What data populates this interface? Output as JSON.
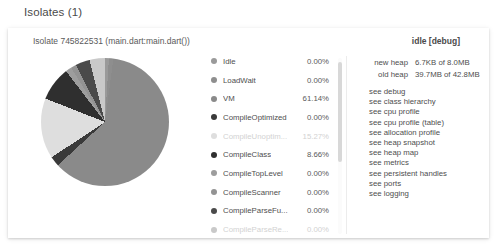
{
  "page": {
    "title": "Isolates (1)"
  },
  "isolate": {
    "title": "Isolate 745822531 (main.dart:main.dart())",
    "state": "idle [debug]"
  },
  "chart_data": {
    "type": "pie",
    "title": "Isolate 745822531 (main.dart:main.dart())",
    "legend_position": "right",
    "categories": [
      "Idle",
      "LoadWait",
      "VM",
      "CompileOptimized",
      "CompileUnoptim...",
      "CompileClass",
      "CompileTopLevel",
      "CompileScanner",
      "CompileParseFu...",
      "CompileParseRe..."
    ],
    "values": [
      0.0,
      0.0,
      61.14,
      0.0,
      15.27,
      8.66,
      0.0,
      0.0,
      0.0,
      0.0
    ],
    "value_labels": [
      "0.00%",
      "0.00%",
      "61.14%",
      "0.00%",
      "15.27%",
      "8.66%",
      "0.00%",
      "0.00%",
      "0.00%",
      "0.00%"
    ],
    "colors": [
      "#9a9a9a",
      "#8e8e8e",
      "#8a8a8a",
      "#3a3a3a",
      "#dedede",
      "#2f2f2f",
      "#9d9d9d",
      "#939393",
      "#4a4a4a",
      "#c9c9c9"
    ],
    "dimmed": [
      false,
      false,
      false,
      false,
      true,
      false,
      false,
      false,
      false,
      true
    ]
  },
  "legend": [
    {
      "label": "Idle",
      "value": "0.00%",
      "color": "#9a9a9a",
      "dim": false
    },
    {
      "label": "LoadWait",
      "value": "0.00%",
      "color": "#8e8e8e",
      "dim": false
    },
    {
      "label": "VM",
      "value": "61.14%",
      "color": "#8a8a8a",
      "dim": false
    },
    {
      "label": "CompileOptimized",
      "value": "0.00%",
      "color": "#3a3a3a",
      "dim": false
    },
    {
      "label": "CompileUnoptim...",
      "value": "15.27%",
      "color": "#dedede",
      "dim": true
    },
    {
      "label": "CompileClass",
      "value": "8.66%",
      "color": "#2f2f2f",
      "dim": false
    },
    {
      "label": "CompileTopLevel",
      "value": "0.00%",
      "color": "#9d9d9d",
      "dim": false
    },
    {
      "label": "CompileScanner",
      "value": "0.00%",
      "color": "#939393",
      "dim": false
    },
    {
      "label": "CompileParseFu...",
      "value": "0.00%",
      "color": "#4a4a4a",
      "dim": false
    },
    {
      "label": "CompileParseRe...",
      "value": "0.00%",
      "color": "#c9c9c9",
      "dim": true
    }
  ],
  "heap": [
    {
      "name": "new heap",
      "value": "6.7KB of 8.0MB"
    },
    {
      "name": "old heap",
      "value": "39.7MB of 42.8MB"
    }
  ],
  "links": [
    "see debug",
    "see class hierarchy",
    "see cpu profile",
    "see cpu profile (table)",
    "see allocation profile",
    "see heap snapshot",
    "see heap map",
    "see metrics",
    "see persistent handles",
    "see ports",
    "see logging"
  ]
}
